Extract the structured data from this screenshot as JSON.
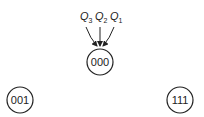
{
  "diagram": {
    "inputs": [
      {
        "label": "Q",
        "sub": "3"
      },
      {
        "label": "Q",
        "sub": "2"
      },
      {
        "label": "Q",
        "sub": "1"
      }
    ],
    "nodes": [
      {
        "id": "center",
        "label": "000"
      },
      {
        "id": "left",
        "label": "001"
      },
      {
        "id": "right",
        "label": "111"
      }
    ],
    "colors": {
      "stroke": "#222222",
      "background": "#ffffff"
    }
  }
}
